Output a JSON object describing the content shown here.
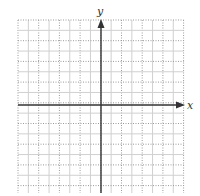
{
  "chart_data": {
    "type": "scatter",
    "title": "",
    "xlabel": "x",
    "ylabel": "y",
    "grid": true,
    "grid_cells": {
      "columns": 16,
      "rows": 17
    },
    "series": [],
    "tick_labels": [],
    "xlim": [
      -8,
      8
    ],
    "ylim": [
      -8.5,
      8
    ]
  },
  "axes": {
    "x_label": "x",
    "y_label": "y"
  },
  "colors": {
    "axis": "#333333",
    "grid_dark": "#9a9a9a",
    "grid_light": "#d0d0d0",
    "background": "#ffffff"
  }
}
